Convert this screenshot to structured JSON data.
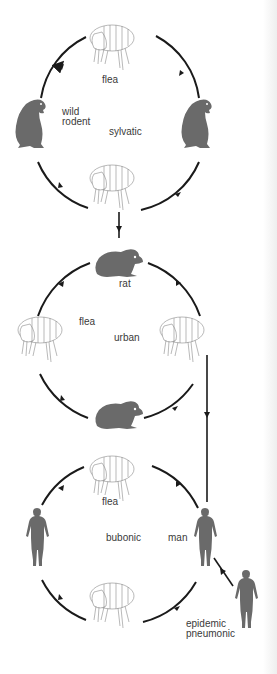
{
  "cycles": [
    {
      "name": "sylvatic",
      "label": "sylvatic",
      "host_label": "wild rodent",
      "host_label_line1": "wild",
      "host_label_line2": "rodent",
      "vector_label": "flea",
      "host": "wild-rodent",
      "direction": "clockwise"
    },
    {
      "name": "urban",
      "label": "urban",
      "host_label": "rat",
      "vector_label": "flea",
      "host": "rat",
      "direction": "clockwise"
    },
    {
      "name": "bubonic",
      "label": "bubonic",
      "host_label": "man",
      "vector_label": "flea",
      "host": "human",
      "direction": "clockwise"
    }
  ],
  "branch": {
    "label_line1": "epidemic",
    "label_line2": "pneumonic",
    "host": "human"
  },
  "links": [
    {
      "from": "sylvatic-flea-bottom",
      "to": "rat"
    },
    {
      "from": "urban-flea-right",
      "to": "man"
    },
    {
      "from": "man",
      "to": "epidemic-pneumonic-human"
    }
  ],
  "colors": {
    "ring": "#1a1a1a",
    "silhouette": "#6a6a6a",
    "flea_outline": "#8a8a8a",
    "text": "#3a3a3a",
    "background": "#ffffff"
  }
}
